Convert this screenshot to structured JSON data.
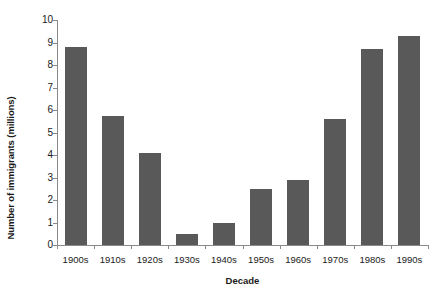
{
  "chart_data": {
    "type": "bar",
    "title": "",
    "subtitle": "",
    "xlabel": "Decade",
    "ylabel": "Number of immigrants (millions)",
    "categories": [
      "1900s",
      "1910s",
      "1920s",
      "1930s",
      "1940s",
      "1950s",
      "1960s",
      "1970s",
      "1980s",
      "1990s"
    ],
    "values": [
      8.8,
      5.75,
      4.1,
      0.5,
      1.0,
      2.5,
      2.9,
      5.6,
      8.7,
      9.3
    ],
    "series": [
      {
        "name": "Number of immigrants (millions)",
        "values": [
          8.8,
          5.75,
          4.1,
          0.5,
          1.0,
          2.5,
          2.9,
          5.6,
          8.7,
          9.3
        ]
      }
    ],
    "ylim": [
      0,
      10
    ],
    "ytick_values": [
      0,
      1,
      2,
      3,
      4,
      5,
      6,
      7,
      8,
      9,
      10
    ],
    "ytick_labels": [
      "0",
      "1",
      "2",
      "3",
      "4",
      "5",
      "6",
      "7",
      "8",
      "9",
      "10"
    ],
    "grid": false,
    "legend": false,
    "legend_position": "none",
    "bar_color": "#595959",
    "axis_color": "#8a8a8a",
    "background_color": "#ffffff",
    "annotations": []
  }
}
